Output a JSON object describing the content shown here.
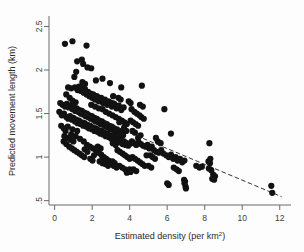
{
  "figure": {
    "background": "#fdfdfd",
    "point_color": "#121212",
    "axis_color": "#6a6a6a",
    "trend_color": "#1a1a1a"
  },
  "chart_data": {
    "type": "scatter",
    "title": "",
    "subtitle": "",
    "xlabel": "Estimated density (per km",
    "xlabel_sup": "2",
    "xlabel_tail": ")",
    "xlabel_full": "Estimated density (per km2)",
    "ylabel": "Predicted movement length (km)",
    "xlim": [
      -0.3,
      12.6
    ],
    "ylim": [
      0.45,
      2.62
    ],
    "xticks": [
      0,
      2,
      4,
      6,
      8,
      10,
      12
    ],
    "xticklabels": [
      "0",
      "2",
      "4",
      "6",
      "8",
      "10",
      "12"
    ],
    "yticks": [
      0.5,
      1,
      1.5,
      2,
      2.5
    ],
    "yticklabels": [
      ".5",
      "1",
      "1.5",
      "2",
      "2.5"
    ],
    "grid": false,
    "legend": null,
    "marker": "filled-circle",
    "marker_size_px": 3.1,
    "trendline": {
      "style": "dashed",
      "x": [
        0.18,
        12.1
      ],
      "y": [
        1.625,
        0.545
      ],
      "slope": -0.0906,
      "intercept": 1.6413
    },
    "n_points": 302,
    "points": [
      [
        0.55,
        2.3
      ],
      [
        0.95,
        2.33
      ],
      [
        1.7,
        2.28
      ],
      [
        1.2,
        2.1
      ],
      [
        1.45,
        2.12
      ],
      [
        1.52,
        2.07
      ],
      [
        1.75,
        2.03
      ],
      [
        1.95,
        2.02
      ],
      [
        1.15,
        1.98
      ],
      [
        2.55,
        1.9
      ],
      [
        0.72,
        1.8
      ],
      [
        0.88,
        1.79
      ],
      [
        1.08,
        1.8
      ],
      [
        1.22,
        1.77
      ],
      [
        1.3,
        1.81
      ],
      [
        1.4,
        1.76
      ],
      [
        1.48,
        1.79
      ],
      [
        1.55,
        1.74
      ],
      [
        1.62,
        1.78
      ],
      [
        1.7,
        1.72
      ],
      [
        1.78,
        1.75
      ],
      [
        1.85,
        1.7
      ],
      [
        1.92,
        1.73
      ],
      [
        2.0,
        1.68
      ],
      [
        2.08,
        1.71
      ],
      [
        2.15,
        1.66
      ],
      [
        2.28,
        1.69
      ],
      [
        2.35,
        1.64
      ],
      [
        2.45,
        1.67
      ],
      [
        2.58,
        1.62
      ],
      [
        2.68,
        1.65
      ],
      [
        2.8,
        1.6
      ],
      [
        2.92,
        1.63
      ],
      [
        3.05,
        1.58
      ],
      [
        3.18,
        1.61
      ],
      [
        3.3,
        1.56
      ],
      [
        3.42,
        1.59
      ],
      [
        3.55,
        1.54
      ],
      [
        3.68,
        1.57
      ],
      [
        4.65,
        1.82
      ],
      [
        3.55,
        1.8
      ],
      [
        3.12,
        1.7
      ],
      [
        3.4,
        1.68
      ],
      [
        3.52,
        1.66
      ],
      [
        3.95,
        1.64
      ],
      [
        4.05,
        1.62
      ],
      [
        4.55,
        1.6
      ],
      [
        4.7,
        1.58
      ],
      [
        5.85,
        1.55
      ],
      [
        0.3,
        1.62
      ],
      [
        0.42,
        1.6
      ],
      [
        0.55,
        1.58
      ],
      [
        0.65,
        1.61
      ],
      [
        0.75,
        1.57
      ],
      [
        0.85,
        1.59
      ],
      [
        0.95,
        1.55
      ],
      [
        1.02,
        1.57
      ],
      [
        1.1,
        1.53
      ],
      [
        1.18,
        1.56
      ],
      [
        1.25,
        1.52
      ],
      [
        1.32,
        1.54
      ],
      [
        1.38,
        1.5
      ],
      [
        1.45,
        1.53
      ],
      [
        1.52,
        1.49
      ],
      [
        1.58,
        1.51
      ],
      [
        1.65,
        1.47
      ],
      [
        1.72,
        1.5
      ],
      [
        1.78,
        1.46
      ],
      [
        1.85,
        1.48
      ],
      [
        1.92,
        1.44
      ],
      [
        1.98,
        1.47
      ],
      [
        2.05,
        1.43
      ],
      [
        2.12,
        1.45
      ],
      [
        2.18,
        1.41
      ],
      [
        2.25,
        1.44
      ],
      [
        2.32,
        1.4
      ],
      [
        2.38,
        1.42
      ],
      [
        2.45,
        1.38
      ],
      [
        2.52,
        1.41
      ],
      [
        2.58,
        1.37
      ],
      [
        2.65,
        1.39
      ],
      [
        2.72,
        1.35
      ],
      [
        2.78,
        1.38
      ],
      [
        2.85,
        1.34
      ],
      [
        2.92,
        1.36
      ],
      [
        2.98,
        1.32
      ],
      [
        3.05,
        1.35
      ],
      [
        3.12,
        1.31
      ],
      [
        3.18,
        1.33
      ],
      [
        3.25,
        1.29
      ],
      [
        3.32,
        1.32
      ],
      [
        3.38,
        1.28
      ],
      [
        3.45,
        1.3
      ],
      [
        3.52,
        1.26
      ],
      [
        3.58,
        1.29
      ],
      [
        3.65,
        1.25
      ],
      [
        0.25,
        1.52
      ],
      [
        0.38,
        1.48
      ],
      [
        0.5,
        1.5
      ],
      [
        0.62,
        1.46
      ],
      [
        0.72,
        1.44
      ],
      [
        0.82,
        1.47
      ],
      [
        0.92,
        1.43
      ],
      [
        1.0,
        1.45
      ],
      [
        1.08,
        1.41
      ],
      [
        1.15,
        1.43
      ],
      [
        1.22,
        1.39
      ],
      [
        1.3,
        1.42
      ],
      [
        1.38,
        1.38
      ],
      [
        1.45,
        1.4
      ],
      [
        1.52,
        1.36
      ],
      [
        1.6,
        1.39
      ],
      [
        1.68,
        1.35
      ],
      [
        1.75,
        1.37
      ],
      [
        1.82,
        1.33
      ],
      [
        1.9,
        1.36
      ],
      [
        1.98,
        1.32
      ],
      [
        2.05,
        1.34
      ],
      [
        2.12,
        1.3
      ],
      [
        2.2,
        1.33
      ],
      [
        2.28,
        1.29
      ],
      [
        2.35,
        1.31
      ],
      [
        2.42,
        1.27
      ],
      [
        2.5,
        1.3
      ],
      [
        2.58,
        1.26
      ],
      [
        2.65,
        1.28
      ],
      [
        2.72,
        1.24
      ],
      [
        2.8,
        1.27
      ],
      [
        2.88,
        1.23
      ],
      [
        2.95,
        1.25
      ],
      [
        3.02,
        1.21
      ],
      [
        3.1,
        1.24
      ],
      [
        3.18,
        1.2
      ],
      [
        3.25,
        1.22
      ],
      [
        3.32,
        1.18
      ],
      [
        3.4,
        1.21
      ],
      [
        3.48,
        1.17
      ],
      [
        3.55,
        1.19
      ],
      [
        3.62,
        1.15
      ],
      [
        3.7,
        1.18
      ],
      [
        3.78,
        1.14
      ],
      [
        3.85,
        1.16
      ],
      [
        3.92,
        1.13
      ],
      [
        4.0,
        1.15
      ],
      [
        1.95,
        1.6
      ],
      [
        2.15,
        1.58
      ],
      [
        2.35,
        1.56
      ],
      [
        2.55,
        1.55
      ],
      [
        2.72,
        1.52
      ],
      [
        2.9,
        1.5
      ],
      [
        3.08,
        1.48
      ],
      [
        3.25,
        1.46
      ],
      [
        3.42,
        1.44
      ],
      [
        3.58,
        1.42
      ],
      [
        3.72,
        1.4
      ],
      [
        3.85,
        1.38
      ],
      [
        2.05,
        1.72
      ],
      [
        2.25,
        1.7
      ],
      [
        2.48,
        1.68
      ],
      [
        2.68,
        1.66
      ],
      [
        2.88,
        1.64
      ],
      [
        3.08,
        1.62
      ],
      [
        0.48,
        1.18
      ],
      [
        0.62,
        1.15
      ],
      [
        0.78,
        1.12
      ],
      [
        0.92,
        1.1
      ],
      [
        1.05,
        1.08
      ],
      [
        1.18,
        1.06
      ],
      [
        1.32,
        1.04
      ],
      [
        1.45,
        1.02
      ],
      [
        1.58,
        1.0
      ],
      [
        0.7,
        1.22
      ],
      [
        0.85,
        1.2
      ],
      [
        1.0,
        1.18
      ],
      [
        0.35,
        1.36
      ],
      [
        0.48,
        1.33
      ],
      [
        0.58,
        1.3
      ],
      [
        0.52,
        1.24
      ],
      [
        0.88,
        1.26
      ],
      [
        1.12,
        1.24
      ],
      [
        1.35,
        1.21
      ],
      [
        1.55,
        1.18
      ],
      [
        1.72,
        1.14
      ],
      [
        1.88,
        1.12
      ],
      [
        2.05,
        1.1
      ],
      [
        2.2,
        1.08
      ],
      [
        2.35,
        1.05
      ],
      [
        2.48,
        1.03
      ],
      [
        2.62,
        1.0
      ],
      [
        2.75,
        0.98
      ],
      [
        2.88,
        0.96
      ],
      [
        3.0,
        0.94
      ],
      [
        2.55,
        1.0
      ],
      [
        2.68,
        0.98
      ],
      [
        2.82,
        0.96
      ],
      [
        2.95,
        0.94
      ],
      [
        3.08,
        0.95
      ],
      [
        3.2,
        0.93
      ],
      [
        2.4,
        0.95
      ],
      [
        2.55,
        0.93
      ],
      [
        2.7,
        0.92
      ],
      [
        2.85,
        0.9
      ],
      [
        3.0,
        0.92
      ],
      [
        3.15,
        0.9
      ],
      [
        3.3,
        0.88
      ],
      [
        3.45,
        0.9
      ],
      [
        3.6,
        0.88
      ],
      [
        3.75,
        0.86
      ],
      [
        3.88,
        0.84
      ],
      [
        4.0,
        0.86
      ],
      [
        3.35,
        1.08
      ],
      [
        3.48,
        1.06
      ],
      [
        3.62,
        1.04
      ],
      [
        3.75,
        1.02
      ],
      [
        3.88,
        1.0
      ],
      [
        4.0,
        0.98
      ],
      [
        4.12,
        1.18
      ],
      [
        4.22,
        1.16
      ],
      [
        4.35,
        1.14
      ],
      [
        4.48,
        1.17
      ],
      [
        4.6,
        1.15
      ],
      [
        4.72,
        1.13
      ],
      [
        4.85,
        1.12
      ],
      [
        4.95,
        1.14
      ],
      [
        5.05,
        1.1
      ],
      [
        5.18,
        1.12
      ],
      [
        4.15,
        1.3
      ],
      [
        4.28,
        1.28
      ],
      [
        4.05,
        1.42
      ],
      [
        4.18,
        1.4
      ],
      [
        4.32,
        1.38
      ],
      [
        4.45,
        1.36
      ],
      [
        4.1,
        1.55
      ],
      [
        4.25,
        1.52
      ],
      [
        4.38,
        1.5
      ],
      [
        4.52,
        1.48
      ],
      [
        4.62,
        1.46
      ],
      [
        4.75,
        1.44
      ],
      [
        4.15,
        1.0
      ],
      [
        4.28,
        0.98
      ],
      [
        4.42,
        0.96
      ],
      [
        4.55,
        0.94
      ],
      [
        4.68,
        0.92
      ],
      [
        4.8,
        0.9
      ],
      [
        4.2,
        0.86
      ],
      [
        4.35,
        0.84
      ],
      [
        3.85,
        0.82
      ],
      [
        3.95,
        0.84
      ],
      [
        4.05,
        0.83
      ],
      [
        5.3,
        1.08
      ],
      [
        5.42,
        1.06
      ],
      [
        5.55,
        1.05
      ],
      [
        5.68,
        1.08
      ],
      [
        5.8,
        1.04
      ],
      [
        5.95,
        1.02
      ],
      [
        6.08,
        1.0
      ],
      [
        6.2,
        1.03
      ],
      [
        6.32,
        0.98
      ],
      [
        6.45,
        1.0
      ],
      [
        6.55,
        0.96
      ],
      [
        6.68,
        0.98
      ],
      [
        6.8,
        0.94
      ],
      [
        6.92,
        0.96
      ],
      [
        5.5,
        1.18
      ],
      [
        5.65,
        1.16
      ],
      [
        6.2,
        1.27
      ],
      [
        6.35,
        0.88
      ],
      [
        6.5,
        0.86
      ],
      [
        6.62,
        0.84
      ],
      [
        6.0,
        0.7
      ],
      [
        6.08,
        0.68
      ],
      [
        6.9,
        0.74
      ],
      [
        6.95,
        0.72
      ],
      [
        6.98,
        0.66
      ],
      [
        7.0,
        0.64
      ],
      [
        6.92,
        0.7
      ],
      [
        7.55,
        0.9
      ],
      [
        7.72,
        0.88
      ],
      [
        7.85,
        0.89
      ],
      [
        8.25,
        1.16
      ],
      [
        8.2,
        0.95
      ],
      [
        8.28,
        0.93
      ],
      [
        8.3,
        0.98
      ],
      [
        8.22,
        0.87
      ],
      [
        8.35,
        0.85
      ],
      [
        8.45,
        0.8
      ],
      [
        8.55,
        0.78
      ],
      [
        8.4,
        0.75
      ],
      [
        8.5,
        0.74
      ],
      [
        11.55,
        0.67
      ],
      [
        11.6,
        0.59
      ],
      [
        5.1,
        1.02
      ],
      [
        5.22,
        1.0
      ],
      [
        5.35,
        0.98
      ],
      [
        5.0,
        0.9
      ],
      [
        5.15,
        0.88
      ],
      [
        4.9,
        1.02
      ],
      [
        2.2,
        1.88
      ],
      [
        2.95,
        1.85
      ],
      [
        1.05,
        1.92
      ],
      [
        0.8,
        1.68
      ],
      [
        0.95,
        1.65
      ],
      [
        1.12,
        1.63
      ],
      [
        0.62,
        1.72
      ],
      [
        0.7,
        1.35
      ],
      [
        0.95,
        1.32
      ],
      [
        1.2,
        1.3
      ],
      [
        2.3,
        1.12
      ],
      [
        2.45,
        1.1
      ],
      [
        3.1,
        1.16
      ],
      [
        3.25,
        1.14
      ],
      [
        2.1,
        1.02
      ],
      [
        1.9,
        0.98
      ],
      [
        2.02,
        0.96
      ],
      [
        1.75,
        1.06
      ],
      [
        1.6,
        1.09
      ],
      [
        4.45,
        1.22
      ],
      [
        4.58,
        1.25
      ],
      [
        5.4,
        1.22
      ],
      [
        3.7,
        1.34
      ],
      [
        3.82,
        1.3
      ],
      [
        3.45,
        1.4
      ],
      [
        1.48,
        1.86
      ],
      [
        1.62,
        1.84
      ]
    ]
  }
}
